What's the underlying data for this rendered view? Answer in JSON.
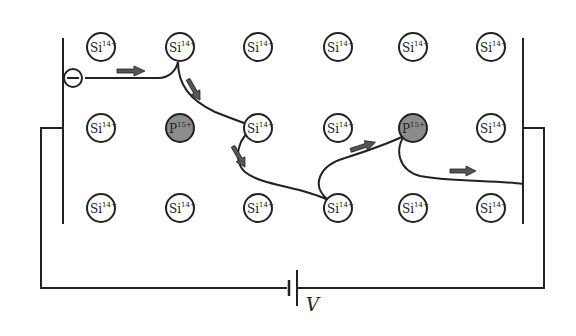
{
  "diagram": {
    "colors": {
      "line": "#222222",
      "si_fill": "#ffffff",
      "p_fill": "#8c8c8c",
      "arrow_fill": "#555555"
    },
    "lattice": {
      "rows": [
        [
          {
            "symbol": "Si",
            "charge": "14+",
            "type": "si"
          },
          {
            "symbol": "Si",
            "charge": "14+",
            "type": "si"
          },
          {
            "symbol": "Si",
            "charge": "14+",
            "type": "si"
          },
          {
            "symbol": "Si",
            "charge": "14+",
            "type": "si"
          },
          {
            "symbol": "Si",
            "charge": "14+",
            "type": "si"
          },
          {
            "symbol": "Si",
            "charge": "14+",
            "type": "si"
          }
        ],
        [
          {
            "symbol": "Si",
            "charge": "14+",
            "type": "si"
          },
          {
            "symbol": "P",
            "charge": "15+",
            "type": "p"
          },
          {
            "symbol": "Si",
            "charge": "14+",
            "type": "si"
          },
          {
            "symbol": "Si",
            "charge": "14+",
            "type": "si"
          },
          {
            "symbol": "P",
            "charge": "15+",
            "type": "p"
          },
          {
            "symbol": "Si",
            "charge": "14+",
            "type": "si"
          }
        ],
        [
          {
            "symbol": "Si",
            "charge": "14+",
            "type": "si"
          },
          {
            "symbol": "Si",
            "charge": "14+",
            "type": "si"
          },
          {
            "symbol": "Si",
            "charge": "14+",
            "type": "si"
          },
          {
            "symbol": "Si",
            "charge": "14+",
            "type": "si"
          },
          {
            "symbol": "Si",
            "charge": "14+",
            "type": "si"
          },
          {
            "symbol": "Si",
            "charge": "14+",
            "type": "si"
          }
        ]
      ]
    },
    "electron": {
      "symbol": "−"
    },
    "battery": {
      "label": "V"
    },
    "arrows_count": 5
  }
}
